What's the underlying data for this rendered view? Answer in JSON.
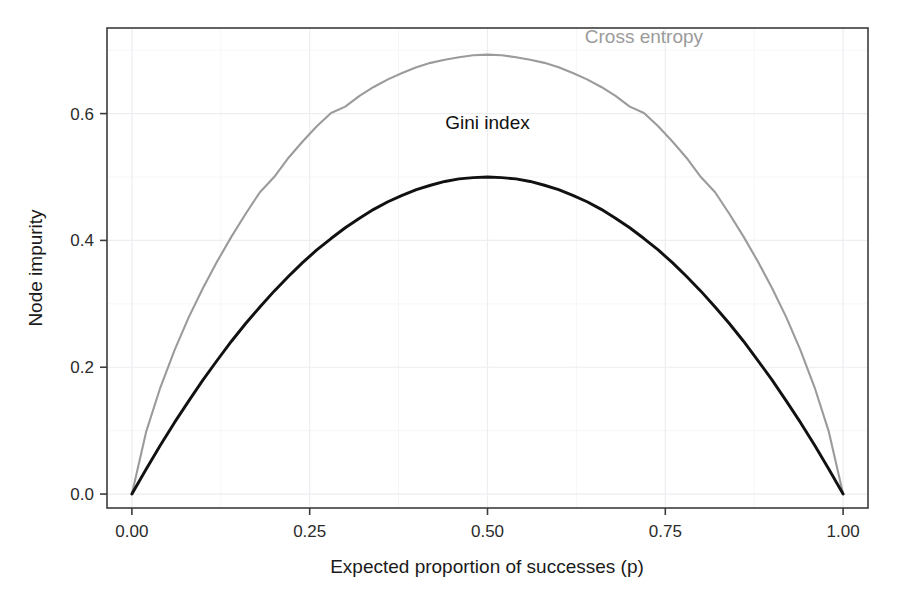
{
  "chart_data": {
    "type": "line",
    "title": "",
    "xlabel": "Expected proportion of successes (p)",
    "ylabel": "Node impurity",
    "xlim": [
      -0.035,
      1.035
    ],
    "ylim": [
      -0.022,
      0.735
    ],
    "grid": true,
    "grid_major_x": [
      0.0,
      0.25,
      0.5,
      0.75,
      1.0
    ],
    "grid_major_y": [
      0.0,
      0.2,
      0.4,
      0.6
    ],
    "grid_minor_x": [
      0.125,
      0.375,
      0.625,
      0.875
    ],
    "grid_minor_y": [
      0.1,
      0.3,
      0.5,
      0.7
    ],
    "xticks": [
      0.0,
      0.25,
      0.5,
      0.75,
      1.0
    ],
    "xticklabels": [
      "0.00",
      "0.25",
      "0.50",
      "0.75",
      "1.00"
    ],
    "yticks": [
      0.0,
      0.2,
      0.4,
      0.6
    ],
    "yticklabels": [
      "0.0",
      "0.2",
      "0.4",
      "0.6"
    ],
    "legend_position": "inline-annotations",
    "annotations": [
      {
        "text": "Cross entropy",
        "x": 0.72,
        "y": 0.712,
        "color": "#9b9b9b"
      },
      {
        "text": "Gini index",
        "x": 0.5,
        "y": 0.575,
        "color": "#111111"
      }
    ],
    "series": [
      {
        "name": "Cross entropy",
        "color": "#9b9b9b",
        "formula": "-p*log(p)-(1-p)*log(1-p)",
        "peak": {
          "x": 0.5,
          "y": 0.693
        },
        "x": [
          0.0,
          0.02,
          0.04,
          0.06,
          0.08,
          0.1,
          0.12,
          0.14,
          0.16,
          0.18,
          0.2,
          0.22,
          0.24,
          0.26,
          0.28,
          0.3,
          0.32,
          0.34,
          0.36,
          0.38,
          0.4,
          0.42,
          0.44,
          0.46,
          0.48,
          0.5,
          0.52,
          0.54,
          0.56,
          0.58,
          0.6,
          0.62,
          0.64,
          0.66,
          0.68,
          0.7,
          0.72,
          0.74,
          0.76,
          0.78,
          0.8,
          0.82,
          0.84,
          0.86,
          0.88,
          0.9,
          0.92,
          0.94,
          0.96,
          0.98,
          1.0
        ],
        "y": [
          0.0,
          0.098,
          0.168,
          0.227,
          0.279,
          0.325,
          0.367,
          0.406,
          0.442,
          0.476,
          0.5,
          0.53,
          0.556,
          0.58,
          0.601,
          0.611,
          0.628,
          0.642,
          0.654,
          0.664,
          0.673,
          0.68,
          0.685,
          0.689,
          0.692,
          0.693,
          0.692,
          0.689,
          0.685,
          0.68,
          0.673,
          0.664,
          0.654,
          0.642,
          0.628,
          0.611,
          0.601,
          0.58,
          0.556,
          0.53,
          0.5,
          0.476,
          0.442,
          0.406,
          0.367,
          0.325,
          0.279,
          0.227,
          0.168,
          0.098,
          0.0
        ]
      },
      {
        "name": "Gini index",
        "color": "#111111",
        "formula": "2*p*(1-p)",
        "peak": {
          "x": 0.5,
          "y": 0.5
        },
        "x": [
          0.0,
          0.02,
          0.04,
          0.06,
          0.08,
          0.1,
          0.12,
          0.14,
          0.16,
          0.18,
          0.2,
          0.22,
          0.24,
          0.26,
          0.28,
          0.3,
          0.32,
          0.34,
          0.36,
          0.38,
          0.4,
          0.42,
          0.44,
          0.46,
          0.48,
          0.5,
          0.52,
          0.54,
          0.56,
          0.58,
          0.6,
          0.62,
          0.64,
          0.66,
          0.68,
          0.7,
          0.72,
          0.74,
          0.76,
          0.78,
          0.8,
          0.82,
          0.84,
          0.86,
          0.88,
          0.9,
          0.92,
          0.94,
          0.96,
          0.98,
          1.0
        ],
        "y": [
          0.0,
          0.039,
          0.077,
          0.113,
          0.147,
          0.18,
          0.211,
          0.241,
          0.269,
          0.295,
          0.32,
          0.343,
          0.365,
          0.385,
          0.403,
          0.42,
          0.435,
          0.449,
          0.461,
          0.471,
          0.48,
          0.487,
          0.493,
          0.497,
          0.499,
          0.5,
          0.499,
          0.497,
          0.493,
          0.487,
          0.48,
          0.471,
          0.461,
          0.449,
          0.435,
          0.42,
          0.403,
          0.385,
          0.365,
          0.343,
          0.32,
          0.295,
          0.269,
          0.241,
          0.211,
          0.18,
          0.147,
          0.113,
          0.077,
          0.039,
          0.0
        ]
      }
    ]
  },
  "axis": {
    "x_title": "Expected proportion of successes (p)",
    "y_title": "Node impurity",
    "x_ticks": [
      "0.00",
      "0.25",
      "0.50",
      "0.75",
      "1.00"
    ],
    "y_ticks": [
      "0.0",
      "0.2",
      "0.4",
      "0.6"
    ]
  },
  "labels": {
    "cross_entropy": "Cross entropy",
    "gini_index": "Gini index"
  },
  "colors": {
    "cross_entropy": "#9b9b9b",
    "gini_index": "#111111",
    "panel_border": "#3c3c3c",
    "grid_major": "#ededf2",
    "grid_minor": "#f6f6f9",
    "background": "#ffffff"
  }
}
